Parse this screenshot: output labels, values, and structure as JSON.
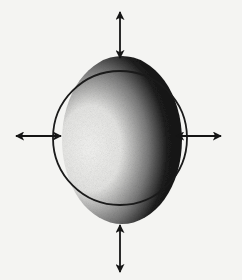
{
  "diagram": {
    "reference_circle": {
      "cx": 120,
      "cy": 138,
      "r": 67,
      "stroke": "#1a1a1a"
    },
    "distorted_body": {
      "cx": 122,
      "cy": 140,
      "rx": 60,
      "ry": 84,
      "light_color": "#f4f4f2",
      "dark_color": "#0d0d0d"
    },
    "arrows": [
      {
        "name": "top",
        "x1": 120,
        "y1": 12,
        "x2": 120,
        "y2": 58
      },
      {
        "name": "bottom",
        "x1": 120,
        "y1": 225,
        "x2": 120,
        "y2": 272
      },
      {
        "name": "left",
        "x1": 16,
        "y1": 136,
        "x2": 61,
        "y2": 136
      },
      {
        "name": "right",
        "x1": 176,
        "y1": 136,
        "x2": 221,
        "y2": 136
      }
    ],
    "colors": {
      "background": "#f4f4f2",
      "ink": "#151515"
    }
  }
}
